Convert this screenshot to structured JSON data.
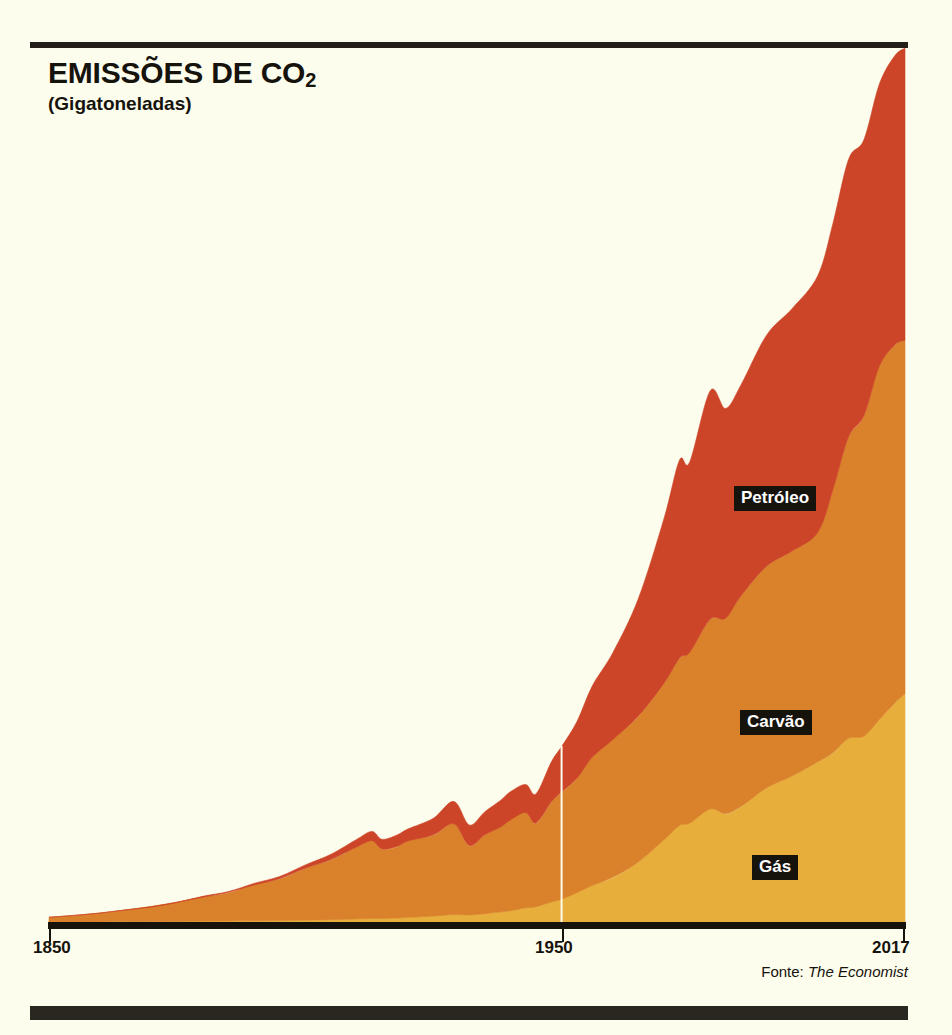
{
  "header": {
    "title_main": "EMISSÕES DE CO",
    "title_sub": "2",
    "subtitle": "(Gigatoneladas)"
  },
  "source": {
    "prefix": "Fonte:",
    "name": "The Economist"
  },
  "colors": {
    "background": "#fdfdee",
    "ink": "#16130d",
    "rule": "#231f18",
    "oil": "#cc4528",
    "coal": "#d9822b",
    "gas": "#e8ae3c",
    "gridline": "#fdfdee"
  },
  "axis": {
    "ticks": [
      {
        "label": "1850",
        "value": 1850
      },
      {
        "label": "1950",
        "value": 1950
      },
      {
        "label": "2017",
        "value": 2017
      }
    ]
  },
  "bands": [
    {
      "key": "oil",
      "label": "Petróleo",
      "color": "#cc4528"
    },
    {
      "key": "coal",
      "label": "Carvão",
      "color": "#d9822b"
    },
    {
      "key": "gas",
      "label": "Gás",
      "color": "#e8ae3c"
    }
  ],
  "chart_data": {
    "type": "area",
    "stacked": true,
    "title": "EMISSÕES DE CO2",
    "subtitle": "(Gigatoneladas)",
    "xlabel": "",
    "ylabel": "Gigatoneladas",
    "xlim": [
      1850,
      2017
    ],
    "ylim": [
      0,
      36
    ],
    "grid": false,
    "legend_position": "inline-labels",
    "xticks": [
      1850,
      1950,
      2017
    ],
    "annotations": [
      {
        "text": "Petróleo",
        "series": "Petróleo"
      },
      {
        "text": "Carvão",
        "series": "Carvão"
      },
      {
        "text": "Gás",
        "series": "Gás"
      }
    ],
    "gridlines_vertical": [
      1950
    ],
    "x": [
      1850,
      1855,
      1860,
      1865,
      1870,
      1875,
      1880,
      1885,
      1890,
      1895,
      1900,
      1905,
      1910,
      1913,
      1915,
      1918,
      1920,
      1925,
      1929,
      1932,
      1935,
      1938,
      1940,
      1943,
      1945,
      1948,
      1950,
      1953,
      1956,
      1960,
      1965,
      1970,
      1973,
      1975,
      1979,
      1982,
      1985,
      1990,
      1995,
      2000,
      2003,
      2006,
      2009,
      2012,
      2015,
      2017
    ],
    "series": [
      {
        "name": "Gás",
        "color": "#e8ae3c",
        "values": [
          0.0,
          0.0,
          0.0,
          0.01,
          0.01,
          0.02,
          0.03,
          0.04,
          0.05,
          0.06,
          0.08,
          0.1,
          0.13,
          0.15,
          0.15,
          0.17,
          0.19,
          0.25,
          0.32,
          0.3,
          0.35,
          0.42,
          0.48,
          0.6,
          0.65,
          0.85,
          0.97,
          1.25,
          1.55,
          1.9,
          2.55,
          3.5,
          4.1,
          4.2,
          4.8,
          4.6,
          4.9,
          5.7,
          6.2,
          6.8,
          7.2,
          7.8,
          7.9,
          8.6,
          9.3,
          9.7
        ]
      },
      {
        "name": "Carvão",
        "color": "#d9822b",
        "values": [
          0.2,
          0.28,
          0.38,
          0.5,
          0.64,
          0.82,
          1.02,
          1.22,
          1.52,
          1.78,
          2.2,
          2.55,
          3.05,
          3.3,
          2.95,
          3.05,
          3.25,
          3.45,
          3.85,
          2.95,
          3.35,
          3.6,
          3.85,
          4.05,
          3.55,
          4.25,
          4.55,
          4.85,
          5.45,
          5.85,
          6.2,
          6.65,
          7.1,
          7.25,
          8.05,
          8.3,
          8.95,
          9.4,
          9.55,
          9.75,
          11.2,
          12.8,
          13.6,
          15.0,
          15.2,
          15.0
        ]
      },
      {
        "name": "Petróleo",
        "color": "#cc4528",
        "values": [
          0.0,
          0.0,
          0.0,
          0.0,
          0.0,
          0.01,
          0.02,
          0.03,
          0.05,
          0.08,
          0.13,
          0.2,
          0.3,
          0.38,
          0.4,
          0.46,
          0.52,
          0.72,
          0.95,
          0.85,
          0.98,
          1.1,
          1.18,
          1.2,
          1.25,
          1.7,
          1.95,
          2.4,
          3.0,
          3.7,
          5.0,
          7.0,
          8.4,
          8.1,
          9.7,
          8.9,
          8.95,
          9.8,
          10.3,
          10.9,
          11.3,
          11.8,
          11.7,
          12.0,
          12.3,
          12.4
        ]
      }
    ]
  }
}
